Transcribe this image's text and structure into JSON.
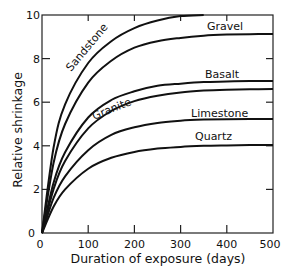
{
  "chart_data": {
    "type": "line",
    "title": "",
    "xlabel": "Duration of exposure (days)",
    "ylabel": "Relative shrinkage",
    "xlim": [
      0,
      500
    ],
    "ylim": [
      0,
      10
    ],
    "x_ticks": [
      0,
      100,
      200,
      300,
      400,
      500
    ],
    "y_ticks": [
      0,
      2,
      4,
      6,
      8,
      10
    ],
    "x_tick_labels": [
      "0",
      "100",
      "200",
      "300",
      "400",
      "500"
    ],
    "y_tick_labels": [
      "0",
      "2",
      "4",
      "6",
      "8",
      "10"
    ],
    "grid": false,
    "legend": "inline labels on curves",
    "x": [
      0,
      25,
      50,
      100,
      150,
      200,
      250,
      300,
      350,
      400,
      450,
      500
    ],
    "series": [
      {
        "name": "Sandstone",
        "values": [
          0,
          3.9,
          5.9,
          7.8,
          8.8,
          9.4,
          9.75,
          9.95,
          10.0,
          null,
          null,
          null
        ]
      },
      {
        "name": "Gravel",
        "values": [
          0,
          3.2,
          5.0,
          6.9,
          7.9,
          8.5,
          8.8,
          8.95,
          9.05,
          9.1,
          9.12,
          9.13
        ]
      },
      {
        "name": "Basalt",
        "values": [
          0,
          2.3,
          3.7,
          5.3,
          6.1,
          6.5,
          6.75,
          6.85,
          6.92,
          6.95,
          6.97,
          6.97
        ]
      },
      {
        "name": "Granite",
        "values": [
          0,
          2.0,
          3.3,
          4.8,
          5.6,
          6.05,
          6.3,
          6.45,
          6.53,
          6.57,
          6.59,
          6.6
        ]
      },
      {
        "name": "Limestone",
        "values": [
          0,
          1.6,
          2.6,
          3.8,
          4.5,
          4.85,
          5.05,
          5.15,
          5.2,
          5.22,
          5.23,
          5.23
        ]
      },
      {
        "name": "Quartz",
        "values": [
          0,
          1.2,
          2.0,
          2.95,
          3.45,
          3.72,
          3.87,
          3.95,
          4.0,
          4.02,
          4.03,
          4.04
        ]
      }
    ]
  },
  "labels": {
    "sandstone": "Sandstone",
    "gravel": "Gravel",
    "basalt": "Basalt",
    "granite": "Granite",
    "limestone": "Limestone",
    "quartz": "Quartz",
    "xlabel": "Duration of exposure (days)",
    "ylabel": "Relative shrinkage",
    "x0": "0",
    "x100": "100",
    "x200": "200",
    "x300": "300",
    "x400": "400",
    "x500": "500",
    "y0": "0",
    "y2": "2",
    "y4": "4",
    "y6": "6",
    "y8": "8",
    "y10": "10"
  }
}
